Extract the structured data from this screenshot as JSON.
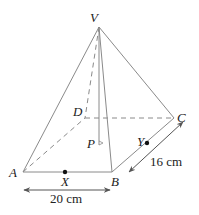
{
  "diagram": {
    "type": "right square-based pyramid",
    "colors": {
      "line": "#8a8a8a",
      "arrow": "#555555",
      "text": "#222222",
      "point": "#111111"
    },
    "vertices": {
      "V": {
        "label": "V",
        "x": 99,
        "y": 27
      },
      "A": {
        "label": "A",
        "x": 23,
        "y": 172
      },
      "B": {
        "label": "B",
        "x": 112,
        "y": 172
      },
      "C": {
        "label": "C",
        "x": 174,
        "y": 118
      },
      "D": {
        "label": "D",
        "x": 85,
        "y": 118
      },
      "P": {
        "label": "P",
        "x": 99,
        "y": 145
      }
    },
    "points": {
      "X": {
        "label": "X",
        "x": 65,
        "y": 172,
        "on": "AB"
      },
      "Y": {
        "label": "Y",
        "x": 147,
        "y": 143,
        "on": "BC"
      }
    },
    "edges_solid": [
      "VA",
      "VB",
      "VC",
      "AB",
      "BC"
    ],
    "edges_dashed": [
      "VD",
      "AD",
      "DC",
      "VP"
    ],
    "dimensions": {
      "ab": {
        "label": "20 cm",
        "edge": "AB"
      },
      "bc": {
        "label": "16 cm",
        "edge": "BC"
      }
    }
  }
}
